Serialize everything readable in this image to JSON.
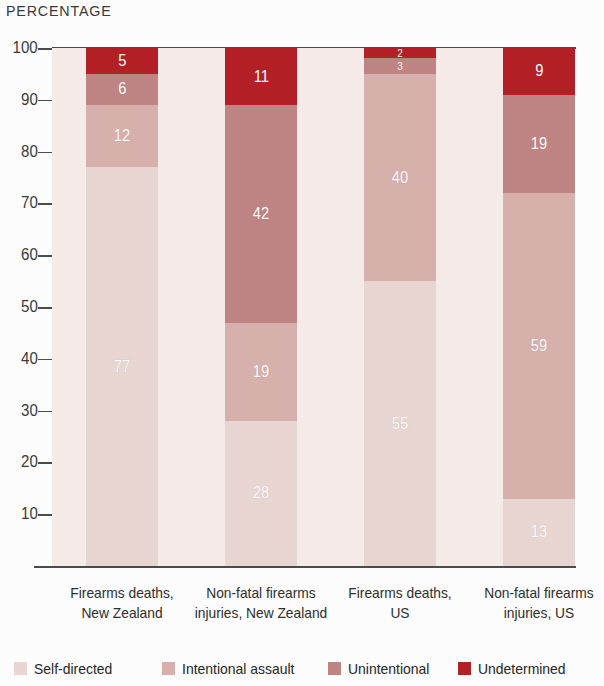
{
  "chart_title": "PERCENTAGE",
  "colors": {
    "self_directed": "#ead8d4",
    "intentional_assault": "#d9b2ae",
    "unintentional": "#c08584",
    "undetermined": "#b52026",
    "plot_background": "#f7eeec",
    "axis": "#4c4c4c",
    "label_text": "#2e2e2e",
    "value_text": "#ffffff"
  },
  "axis": {
    "y_ticks": [
      "10",
      "20",
      "30",
      "40",
      "50",
      "60",
      "70",
      "80",
      "90",
      "100"
    ],
    "y_min": 0,
    "y_max": 100
  },
  "legend": {
    "items": [
      {
        "label": "Self-directed",
        "color": "#ead8d4"
      },
      {
        "label": "Intentional assault",
        "color": "#d9b2ae"
      },
      {
        "label": "Unintentional",
        "color": "#c08584"
      },
      {
        "label": "Undetermined",
        "color": "#b52026"
      }
    ]
  },
  "categories": [
    {
      "line1": "Firearms deaths,",
      "line2": "New Zealand"
    },
    {
      "line1": "Non-fatal firearms",
      "line2": "injuries, New Zealand"
    },
    {
      "line1": "Firearms deaths,",
      "line2": "US"
    },
    {
      "line1": "Non-fatal firearms",
      "line2": "injuries, US"
    }
  ],
  "chart_data": {
    "type": "bar",
    "subtype": "stacked-vertical-100",
    "title": "PERCENTAGE",
    "xlabel": "",
    "ylabel": "PERCENTAGE",
    "ylim": [
      0,
      100
    ],
    "ytick_step": 10,
    "grid": false,
    "legend_position": "bottom",
    "categories": [
      "Firearms deaths, New Zealand",
      "Non-fatal firearms injuries, New Zealand",
      "Firearms deaths, US",
      "Non-fatal firearms injuries, US"
    ],
    "series": [
      {
        "name": "Self-directed",
        "color": "#ead8d4",
        "values": [
          77,
          28,
          55,
          13
        ]
      },
      {
        "name": "Intentional assault",
        "color": "#d9b2ae",
        "values": [
          12,
          19,
          40,
          59
        ]
      },
      {
        "name": "Unintentional",
        "color": "#c08584",
        "values": [
          6,
          42,
          3,
          19
        ]
      },
      {
        "name": "Undetermined",
        "color": "#b52026",
        "values": [
          5,
          11,
          2,
          9
        ]
      }
    ],
    "bars": [
      {
        "category": "Firearms deaths, New Zealand",
        "segments": [
          {
            "name": "Self-directed",
            "value": 77,
            "label": "77"
          },
          {
            "name": "Intentional assault",
            "value": 12,
            "label": "12"
          },
          {
            "name": "Unintentional",
            "value": 6,
            "label": "6"
          },
          {
            "name": "Undetermined",
            "value": 5,
            "label": "5"
          }
        ]
      },
      {
        "category": "Non-fatal firearms injuries, New Zealand",
        "segments": [
          {
            "name": "Self-directed",
            "value": 28,
            "label": "28"
          },
          {
            "name": "Intentional assault",
            "value": 19,
            "label": "19"
          },
          {
            "name": "Unintentional",
            "value": 42,
            "label": "42"
          },
          {
            "name": "Undetermined",
            "value": 11,
            "label": "11"
          }
        ]
      },
      {
        "category": "Firearms deaths, US",
        "segments": [
          {
            "name": "Self-directed",
            "value": 55,
            "label": "55"
          },
          {
            "name": "Intentional assault",
            "value": 40,
            "label": "40"
          },
          {
            "name": "Unintentional",
            "value": 3,
            "label": "3"
          },
          {
            "name": "Undetermined",
            "value": 2,
            "label": "2"
          }
        ]
      },
      {
        "category": "Non-fatal firearms injuries, US",
        "segments": [
          {
            "name": "Self-directed",
            "value": 13,
            "label": "13"
          },
          {
            "name": "Intentional assault",
            "value": 59,
            "label": "59"
          },
          {
            "name": "Unintentional",
            "value": 19,
            "label": "19"
          },
          {
            "name": "Undetermined",
            "value": 9,
            "label": "9"
          }
        ]
      }
    ]
  }
}
